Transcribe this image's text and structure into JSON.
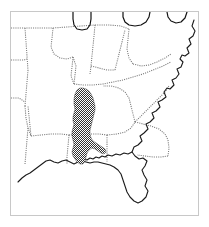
{
  "figure": {
    "kind": "distribution-range-map",
    "region_title": "Southeastern United States",
    "caption": "",
    "frame_color": "#c8c8c8",
    "background_color": "#ffffff"
  },
  "legend": {
    "range_label": "Shaded range",
    "range_color": "#3d3d3d",
    "state_border_color": "#7a7a7a",
    "coastline_color": "#1a1a1a"
  },
  "chart_data": {
    "type": "map",
    "projection_note": "unprojected outline sketch",
    "features": {
      "coastline": {
        "name": "atlantic-gulf-coastline",
        "stroke": "#1a1a1a",
        "style": "solid",
        "path": "M 183 8 L 181 14 L 184 19 L 182 24 L 178 27 L 180 32 L 176 36 L 178 41 L 174 44 L 171 43 L 169 47 L 172 50 L 170 55 L 166 57 L 168 62 L 165 66 L 161 68 L 163 73 L 159 77 L 156 76 L 153 80 L 155 85 L 151 88 L 147 90 L 149 95 L 145 99 L 141 101 L 143 106 L 139 110 L 135 112 L 137 117 L 133 121 L 129 124 L 131 129 L 127 133 L 123 135 L 121 140 L 124 144 L 128 147 L 132 146 L 136 149 L 134 154 L 131 158 L 133 163 L 136 168 L 134 174 L 137 179 L 135 185 L 131 189 L 127 191 L 123 189 L 119 185 L 116 180 L 114 174 L 112 168 L 110 162 L 107 158 L 103 155 L 99 153 L 95 152 L 91 151 L 87 150 L 83 150 L 79 151 L 75 150 L 71 149 L 67 150 L 63 152 L 59 150 L 55 148 L 51 149 L 47 151 L 43 150 L 39 148 L 35 149 L 31 152 L 27 155 L 23 158 L 19 161 L 15 163 L 11 166 L 7 170"
      },
      "gulf_coast_detail": {
        "name": "gulf-coast-indentations",
        "stroke": "#1a1a1a",
        "style": "solid",
        "path": "M 121 140 L 117 142 L 113 141 L 109 143 L 105 142 L 101 144 L 97 143 L 94 145 L 91 144 L 88 146 L 85 145 L 82 147 L 79 146 L 76 148 L 73 147 L 70 149 L 66 148"
      },
      "great_lakes": {
        "name": "great-lakes-outline",
        "stroke": "#111111",
        "style": "solid",
        "path": "M 62 0 L 62 7 L 63 13 L 66 17 L 71 18 L 76 17 L 79 13 L 80 7 L 80 0 M 112 0 L 112 5 L 114 10 L 118 13 L 124 14 L 130 13 L 135 10 L 138 5 L 139 0 M 156 0 L 157 5 L 160 9 L 165 11 L 170 10 L 174 6 L 176 0"
      },
      "state_borders": {
        "name": "state-boundary-lines",
        "stroke": "#7a7a7a",
        "style": "dotted",
        "paths": [
          "M 0 16 L 14 16 L 28 16 L 42 16",
          "M 14 16 L 15 30 L 16 44 L 17 58",
          "M 0 48 L 13 48 L 16 47",
          "M 17 58 L 16 70 L 15 82 L 14 94",
          "M 0 86 L 8 86 L 14 90",
          "M 14 94 L 15 106 L 17 116 L 20 124",
          "M 42 16 L 41 26 L 40 35 L 43 42 L 49 46 L 56 47 L 62 45",
          "M 62 45 L 61 55 L 60 64 L 63 72",
          "M 42 16 L 56 15 L 70 14 L 84 13",
          "M 84 13 L 83 24 L 82 34 L 81 44 L 80 54 L 79 62",
          "M 84 13 L 98 13 L 110 14 L 118 17",
          "M 118 17 L 117 27 L 116 37 L 118 46 L 122 52",
          "M 122 52 L 130 54 L 138 53 L 146 50 L 154 46 L 160 42",
          "M 63 72 L 72 73 L 82 73 L 92 72 L 102 70 L 112 68 L 122 65 L 132 62 L 142 58 L 152 54 L 160 50",
          "M 20 124 L 30 123 L 40 122 L 50 122 L 58 123",
          "M 58 123 L 57 134 L 56 145 L 56 152",
          "M 17 116 L 16 128 L 15 140 L 14 152",
          "M 58 123 L 68 122 L 78 122 L 88 122 L 96 123",
          "M 96 123 L 96 134 L 96 144 L 96 150",
          "M 96 123 L 106 122 L 114 120 L 120 116 L 124 110",
          "M 124 110 L 122 102 L 120 94 L 118 86 L 114 80 L 108 76 L 100 74 L 92 74",
          "M 124 110 L 132 112 L 140 114 L 148 117 L 154 122 L 157 128 L 158 136 L 157 144",
          "M 157 144 L 150 145 L 142 145 L 134 144 L 126 143",
          "M 124 110 L 130 104 L 136 98 L 142 92 L 148 86 L 154 80 L 158 74",
          "M 20 124 L 19 114 L 18 104 L 17 94",
          "M 63 72 L 64 63 L 65 54 L 62 45",
          "M 80 54 L 88 56 L 96 58 L 104 58",
          "M 104 58 L 106 50 L 108 42 L 110 34 L 112 26 L 114 18"
        ]
      },
      "range_polygon": {
        "name": "shaded-range-area",
        "label": "Shaded distribution range",
        "fill_pattern": "dither-checker",
        "fill_color": "#3d3d3d",
        "path": "M 66 78 L 64 82 L 63 87 L 63 92 L 64 97 L 63 101 L 62 105 L 62 109 L 63 112 L 62 116 L 61 120 L 61 124 L 62 128 L 63 132 L 62 136 L 61 140 L 62 144 L 64 147 L 66 150 L 69 152 L 72 152 L 74 149 L 75 145 L 76 141 L 78 138 L 81 136 L 84 137 L 87 139 L 90 141 L 93 142 L 95 140 L 94 137 L 91 135 L 88 133 L 85 131 L 82 129 L 80 126 L 79 122 L 79 118 L 80 114 L 81 110 L 82 106 L 83 102 L 84 98 L 84 94 L 83 90 L 82 86 L 80 82 L 78 79 L 75 77 L 72 76 L 69 76 Z"
      }
    }
  }
}
